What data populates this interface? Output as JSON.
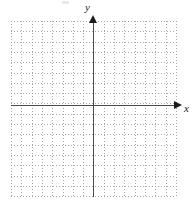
{
  "figure": {
    "title": "",
    "background_color": "#ffffff",
    "artifact_present": true
  },
  "axes": {
    "x": {
      "label": "x",
      "label_style": "italic",
      "arrow": "right-arrow-icon",
      "color": "#4a4a4a",
      "pixel_y": 105,
      "start_px": 11,
      "end_px": 178
    },
    "y": {
      "label": "y",
      "label_style": "italic",
      "arrow": "up-arrow-icon",
      "color": "#4a4a4a",
      "pixel_x": 93,
      "start_px": 21,
      "end_px": 197
    }
  },
  "grid": {
    "color": "#a8a8a8",
    "style": "dotted",
    "left_px": 11,
    "top_px": 21,
    "width_px": 165,
    "height_px": 176,
    "cell_px": 10.3,
    "columns": 16,
    "rows": 17,
    "visible": true
  },
  "chart_data": {
    "type": "scatter",
    "title": "",
    "xlabel": "x",
    "ylabel": "y",
    "xlim": [
      -8,
      8
    ],
    "ylim": [
      -9,
      8
    ],
    "xticks": [
      -8,
      -7,
      -6,
      -5,
      -4,
      -3,
      -2,
      -1,
      0,
      1,
      2,
      3,
      4,
      5,
      6,
      7,
      8
    ],
    "yticks": [
      -9,
      -8,
      -7,
      -6,
      -5,
      -4,
      -3,
      -2,
      -1,
      0,
      1,
      2,
      3,
      4,
      5,
      6,
      7,
      8
    ],
    "xtick_labels": [],
    "ytick_labels": [],
    "grid": true,
    "legend": null,
    "series": [],
    "x": [],
    "y": [],
    "annotations": []
  }
}
